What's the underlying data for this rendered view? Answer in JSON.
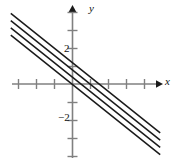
{
  "figure": {
    "name": "family-of-parallel-lines-graph",
    "background": "#ffffff",
    "axis_color": "#808080",
    "line_color": "#1a1a1a",
    "label_color": "#111111"
  },
  "axes": {
    "x_label": "x",
    "y_label": "y",
    "origin_px": {
      "x": 72,
      "y": 84
    },
    "unit_px": 18,
    "x_range": [
      -3.4,
      4.9
    ],
    "y_range": [
      -4.1,
      4.4
    ],
    "x_axis_px": {
      "x1": 12,
      "x2": 162,
      "y": 84
    },
    "y_axis_px": {
      "y1": 6,
      "y2": 158,
      "x": 72
    },
    "x_ticks": [
      -3,
      -2,
      -1,
      1,
      2,
      3,
      4
    ],
    "y_ticks": [
      -4,
      -3,
      -2,
      -1,
      1,
      2,
      3,
      4
    ],
    "x_tick_labels": [],
    "y_tick_labels": [
      {
        "value": 2,
        "text": "2"
      },
      {
        "value": -2,
        "text": "−2"
      }
    ],
    "grid": false,
    "arrowheads": [
      "x-positive",
      "y-positive"
    ]
  },
  "chart_data": {
    "type": "line",
    "title": "",
    "xlabel": "x",
    "ylabel": "y",
    "xlim": [
      -3.4,
      4.9
    ],
    "ylim": [
      -4.1,
      4.4
    ],
    "grid": false,
    "legend": "none",
    "slope": -0.8,
    "series": [
      {
        "name": "line-1",
        "intercept": 1.2,
        "slope": -0.8,
        "endpoints": [
          {
            "x": -3.4,
            "y": 3.92
          },
          {
            "x": 4.9,
            "y": -2.72
          }
        ]
      },
      {
        "name": "line-2",
        "intercept": 0.8,
        "slope": -0.8,
        "endpoints": [
          {
            "x": -3.4,
            "y": 3.52
          },
          {
            "x": 4.9,
            "y": -3.12
          }
        ]
      },
      {
        "name": "line-3",
        "intercept": 0.4,
        "slope": -0.8,
        "endpoints": [
          {
            "x": -3.4,
            "y": 3.12
          },
          {
            "x": 4.9,
            "y": -3.52
          }
        ]
      },
      {
        "name": "line-4",
        "intercept": 0.0,
        "slope": -0.8,
        "endpoints": [
          {
            "x": -3.4,
            "y": 2.72
          },
          {
            "x": 4.9,
            "y": -3.92
          }
        ]
      }
    ]
  }
}
